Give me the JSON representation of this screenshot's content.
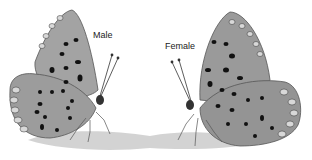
{
  "figure": {
    "labels": {
      "male": "Male",
      "female": "Female"
    },
    "colors": {
      "wing_base": "#9a9a9a",
      "wing_light": "#c9c9c9",
      "spot": "#111111",
      "shadow": "#b8b8b8",
      "background": "#ffffff"
    }
  }
}
